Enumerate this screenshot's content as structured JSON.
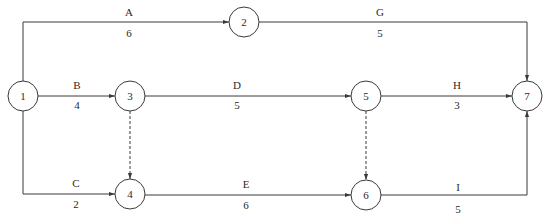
{
  "diagram": {
    "type": "activity-on-arrow network",
    "colors": {
      "line": "#3a3a3a",
      "text": "#2a2a2a",
      "background": "#ffffff",
      "bleed_text": "#ececec"
    },
    "nodes": [
      {
        "id": "1",
        "label": "1",
        "cx": 23,
        "cy": 96
      },
      {
        "id": "2",
        "label": "2",
        "cx": 244,
        "cy": 22
      },
      {
        "id": "3",
        "label": "3",
        "cx": 130,
        "cy": 96
      },
      {
        "id": "4",
        "label": "4",
        "cx": 130,
        "cy": 194
      },
      {
        "id": "5",
        "label": "5",
        "cx": 366,
        "cy": 96
      },
      {
        "id": "6",
        "label": "6",
        "cx": 366,
        "cy": 195
      },
      {
        "id": "7",
        "label": "7",
        "cx": 527,
        "cy": 96
      }
    ],
    "activities": [
      {
        "name": "A",
        "duration": "6",
        "from": "1",
        "to": "2",
        "dummy": false
      },
      {
        "name": "B",
        "duration": "4",
        "from": "1",
        "to": "3",
        "dummy": false
      },
      {
        "name": "C",
        "duration": "2",
        "from": "1",
        "to": "4",
        "dummy": false
      },
      {
        "name": "D",
        "duration": "5",
        "from": "3",
        "to": "5",
        "dummy": false
      },
      {
        "name": "E",
        "duration": "6",
        "from": "4",
        "to": "6",
        "dummy": false
      },
      {
        "name": "G",
        "duration": "5",
        "from": "2",
        "to": "7",
        "dummy": false
      },
      {
        "name": "H",
        "duration": "3",
        "from": "5",
        "to": "7",
        "dummy": false
      },
      {
        "name": "I",
        "duration": "5",
        "from": "6",
        "to": "7",
        "dummy": false
      },
      {
        "name": "",
        "duration": "",
        "from": "3",
        "to": "4",
        "dummy": true
      },
      {
        "name": "",
        "duration": "",
        "from": "5",
        "to": "6",
        "dummy": true
      }
    ]
  },
  "labels": {
    "A": "A",
    "A_dur": "6",
    "B": "B",
    "B_dur": "4",
    "C": "C",
    "C_dur": "2",
    "D": "D",
    "D_dur": "5",
    "E": "E",
    "E_dur": "6",
    "G": "G",
    "G_dur": "5",
    "H": "H",
    "H_dur": "3",
    "I": "I",
    "I_dur": "5",
    "n1": "1",
    "n2": "2",
    "n3": "3",
    "n4": "4",
    "n5": "5",
    "n6": "6",
    "n7": "7"
  }
}
